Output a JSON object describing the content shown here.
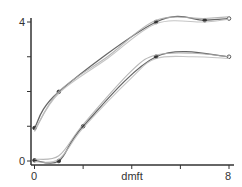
{
  "chart_data": {
    "type": "line",
    "title": "",
    "xlabel": "dmft",
    "ylabel": "",
    "xlim": [
      0,
      8
    ],
    "ylim": [
      0,
      4
    ],
    "x_ticks": [
      0,
      2,
      4,
      6,
      8
    ],
    "x_tick_labels": [
      "0",
      "",
      "",
      "",
      "8"
    ],
    "y_ticks": [
      0,
      1,
      2,
      3,
      4
    ],
    "y_tick_labels": [
      "0",
      "",
      "",
      "",
      "4"
    ],
    "grid": false,
    "legend": null,
    "series": [
      {
        "name": "upper-fitted",
        "style": "points+line",
        "color": "#555555",
        "points": [
          [
            0,
            0.95
          ],
          [
            1,
            1.99
          ],
          [
            5,
            4.0
          ],
          [
            7,
            4.05
          ],
          [
            8,
            4.1
          ]
        ]
      },
      {
        "name": "upper-smooth-a",
        "style": "line",
        "color": "#aaaaaa",
        "points": [
          [
            0,
            0.85
          ],
          [
            1,
            2.0
          ],
          [
            3,
            3.0
          ],
          [
            5,
            4.05
          ],
          [
            7,
            4.1
          ],
          [
            8,
            4.15
          ]
        ]
      },
      {
        "name": "upper-smooth-b",
        "style": "line",
        "color": "#bbbbbb",
        "points": [
          [
            0,
            0.9
          ],
          [
            1,
            1.95
          ],
          [
            3,
            2.95
          ],
          [
            5,
            3.95
          ],
          [
            7,
            4.0
          ],
          [
            8,
            4.08
          ]
        ]
      },
      {
        "name": "lower-fitted",
        "style": "points+line",
        "color": "#555555",
        "points": [
          [
            0,
            0.02
          ],
          [
            1,
            0.0
          ],
          [
            2,
            1.0
          ],
          [
            5,
            3.0
          ],
          [
            8,
            3.0
          ]
        ]
      },
      {
        "name": "lower-smooth-a",
        "style": "line",
        "color": "#aaaaaa",
        "points": [
          [
            0,
            0.05
          ],
          [
            1,
            0.15
          ],
          [
            2,
            1.05
          ],
          [
            4,
            2.6
          ],
          [
            5,
            3.05
          ],
          [
            6.5,
            3.1
          ],
          [
            8,
            3.0
          ]
        ]
      },
      {
        "name": "lower-smooth-b",
        "style": "line",
        "color": "#bbbbbb",
        "points": [
          [
            0,
            -0.02
          ],
          [
            1,
            0.05
          ],
          [
            2,
            0.95
          ],
          [
            4,
            2.4
          ],
          [
            5,
            2.95
          ],
          [
            6.5,
            3.0
          ],
          [
            8,
            2.95
          ]
        ]
      }
    ]
  },
  "axes": {
    "x_label": "dmft",
    "x_min_label": "0",
    "x_max_label": "8",
    "y_min_label": "0",
    "y_max_label": "4"
  },
  "colors": {
    "axis": "#333333",
    "fitted": "#555555",
    "smooth_light": "#aaaaaa",
    "smooth_lighter": "#c4c4c4",
    "marker": "#333333"
  }
}
